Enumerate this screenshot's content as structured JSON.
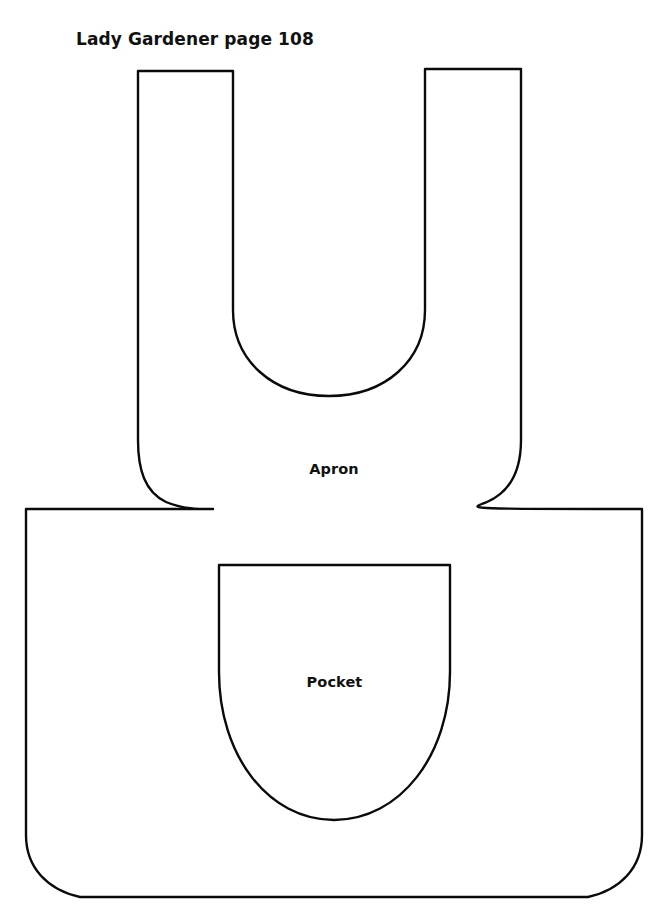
{
  "sheet": {
    "title": "Lady Gardener page 108",
    "background_color": "#ffffff",
    "ink_color": "#0a0a0a",
    "width": 668,
    "height": 911
  },
  "pieces": {
    "apron": {
      "label": "Apron",
      "outline_path": "M 138 71 L 233 71 L 233 310 C 233 360 272 396 329 396 C 386 396 425 360 425 310 L 425 69 L 521 69 L 521 440 C 521 470 510 492 487 502 C 470 509 455 509 642 509 L 642 835 C 642 868 620 890 588 897 L 80 897 C 48 890 26 868 26 835 L 26 509 L 213 509 C 198 509 183 509 166 502 C 145 492 138 470 138 440 Z"
    },
    "pocket": {
      "label": "Pocket",
      "outline_path": "M 219 565 L 450 565 L 450 672 C 450 755 400 820 334 820 C 268 820 219 755 219 672 Z"
    }
  }
}
